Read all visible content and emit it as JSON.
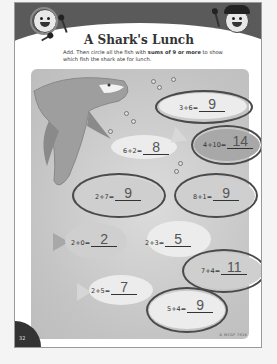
{
  "worksheet": {
    "title": "A Shark's Lunch",
    "instructions": {
      "part1": "Add. Then circle all the fish with ",
      "emphasis": "sums of 9 or more",
      "part2": " to show which fish the shark ate for lunch."
    },
    "problems": [
      {
        "expression": "3+6=",
        "answer": "9",
        "circled": true
      },
      {
        "expression": "6+2=",
        "answer": "8",
        "circled": false
      },
      {
        "expression": "4+10=",
        "answer": "14",
        "circled": true
      },
      {
        "expression": "2+7=",
        "answer": "9",
        "circled": true
      },
      {
        "expression": "8+1=",
        "answer": "9",
        "circled": true
      },
      {
        "expression": "2+0=",
        "answer": "2",
        "circled": false
      },
      {
        "expression": "2+3=",
        "answer": "5",
        "circled": false
      },
      {
        "expression": "7+4=",
        "answer": "11",
        "circled": true
      },
      {
        "expression": "2+5=",
        "answer": "7",
        "circled": false
      },
      {
        "expression": "5+4=",
        "answer": "9",
        "circled": true
      }
    ],
    "page_number": "32",
    "copyright": "© MCGF 7516"
  },
  "icons": {
    "left_character": "girl-character-icon",
    "right_character": "boy-character-icon",
    "shark": "shark-illustration",
    "fish": "fish-illustration"
  },
  "colors": {
    "header": "#5a5a5a",
    "scene": "#c8c8c8",
    "ink": "#333333",
    "circle": "#4a4a4a"
  }
}
